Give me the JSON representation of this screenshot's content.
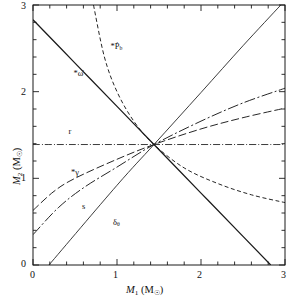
{
  "figure": {
    "kind": "mass-mass-diagram",
    "background": "#ffffff",
    "ink": "#1a1a1a"
  },
  "axes": {
    "x_label": "M",
    "x_label_sub": "1",
    "x_label_unit": "(M",
    "x_label_unit_sub": "☉",
    "x_label_unit_close": ")",
    "y_label": "M",
    "y_label_sub": "2",
    "y_label_unit": "(M",
    "y_label_unit_sub": "☉",
    "y_label_unit_close": ")",
    "x_ticks": [
      "0",
      "1",
      "2",
      "3"
    ],
    "y_ticks": [
      "0",
      "1",
      "2",
      "3"
    ],
    "x_range": [
      0,
      3
    ],
    "y_range": [
      0,
      3
    ],
    "minor_tick_step": 0.2,
    "grid": "off"
  },
  "curve_labels": [
    {
      "id": "pbdot-label",
      "text": "*Ṗ",
      "sub": "b",
      "x": 0.97,
      "y": 2.52
    },
    {
      "id": "omegadot-label",
      "text": "*ω̇",
      "sub": "",
      "x": 0.53,
      "y": 2.2
    },
    {
      "id": "r-label",
      "text": "r",
      "sub": "",
      "x": 0.47,
      "y": 1.53
    },
    {
      "id": "gamma-label",
      "text": "*γ",
      "sub": "",
      "x": 0.5,
      "y": 1.06
    },
    {
      "id": "s-label",
      "text": "s",
      "sub": "",
      "x": 0.63,
      "y": 0.67
    },
    {
      "id": "deltatheta-label",
      "text": "δ",
      "sub": "θ",
      "x": 1.0,
      "y": 0.48
    }
  ],
  "chart_data": {
    "type": "line",
    "title": "",
    "xlabel": "M1 (Msun)",
    "ylabel": "M2 (Msun)",
    "xlim": [
      0,
      3
    ],
    "ylim": [
      0,
      3
    ],
    "grid": false,
    "legend": "inline-annotations",
    "intersection": {
      "M1": 1.44,
      "M2": 1.39
    },
    "series": [
      {
        "name": "omega-dot",
        "label": "*ω̇",
        "style": "solid",
        "comment": "total mass constraint: M1 + M2 = const = 2.83",
        "points": [
          [
            0.0,
            2.83
          ],
          [
            0.5,
            2.33
          ],
          [
            1.0,
            1.83
          ],
          [
            1.44,
            1.39
          ],
          [
            2.0,
            0.83
          ],
          [
            2.5,
            0.33
          ],
          [
            2.83,
            0.0
          ]
        ]
      },
      {
        "name": "Pb-dot",
        "label": "*Ṗb",
        "style": "dashed",
        "comment": "steeply falling mass-ratio style curve through intersection",
        "points": [
          [
            0.72,
            3.0
          ],
          [
            0.85,
            2.4
          ],
          [
            1.0,
            2.0
          ],
          [
            1.2,
            1.66
          ],
          [
            1.44,
            1.39
          ],
          [
            1.8,
            1.12
          ],
          [
            2.2,
            0.94
          ],
          [
            2.6,
            0.81
          ],
          [
            3.0,
            0.72
          ]
        ]
      },
      {
        "name": "r",
        "label": "r",
        "style": "dash-dot",
        "comment": "companion mass (Shapiro range) = horizontal line at M2 = 1.39",
        "points": [
          [
            0.0,
            1.39
          ],
          [
            3.0,
            1.39
          ]
        ]
      },
      {
        "name": "gamma",
        "label": "*γ",
        "style": "long-dash",
        "comment": "gravitational redshift/time dilation curve, rising",
        "points": [
          [
            0.0,
            0.63
          ],
          [
            0.25,
            0.85
          ],
          [
            0.5,
            1.0
          ],
          [
            1.0,
            1.22
          ],
          [
            1.44,
            1.39
          ],
          [
            2.0,
            1.57
          ],
          [
            2.5,
            1.7
          ],
          [
            3.0,
            1.81
          ]
        ]
      },
      {
        "name": "s",
        "label": "s",
        "style": "dash-dot-long",
        "comment": "Shapiro shape parameter sin(i), rising more steeply",
        "points": [
          [
            0.0,
            0.35
          ],
          [
            0.3,
            0.66
          ],
          [
            0.6,
            0.89
          ],
          [
            1.0,
            1.13
          ],
          [
            1.44,
            1.39
          ],
          [
            2.0,
            1.66
          ],
          [
            2.5,
            1.87
          ],
          [
            3.0,
            2.04
          ]
        ]
      },
      {
        "name": "delta-theta",
        "label": "δθ",
        "style": "thin-solid",
        "comment": "near-straight rising line from M1=0.19 to top-right corner",
        "points": [
          [
            0.19,
            0.0
          ],
          [
            1.0,
            0.92
          ],
          [
            1.44,
            1.39
          ],
          [
            2.0,
            1.99
          ],
          [
            2.5,
            2.53
          ],
          [
            2.95,
            3.0
          ]
        ]
      }
    ]
  }
}
